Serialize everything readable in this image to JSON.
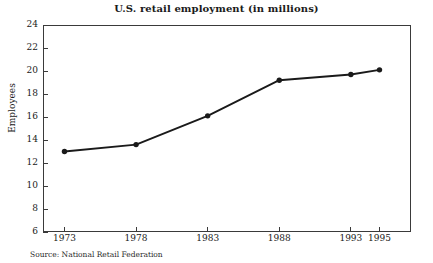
{
  "chart_data": {
    "type": "line",
    "title": "U.S. retail employment (in millions)",
    "xlabel": "",
    "ylabel": "Employees",
    "x": [
      1973,
      1978,
      1983,
      1988,
      1993,
      1995
    ],
    "xtick_labels": [
      "1973",
      "1978",
      "1983",
      "1988",
      "1993",
      "1995"
    ],
    "values": [
      13.0,
      13.6,
      16.1,
      19.2,
      19.7,
      20.1
    ],
    "ytick_labels": [
      "24",
      "22",
      "20",
      "18",
      "16",
      "14",
      "12",
      "10",
      "8",
      "6"
    ],
    "yticks": [
      24,
      22,
      20,
      18,
      16,
      14,
      12,
      10,
      8,
      6
    ],
    "ylim": [
      6,
      24
    ],
    "xlim": [
      1971.5,
      1997.2
    ],
    "grid": false,
    "legend": false,
    "marker": "filled-circle",
    "line_color": "#1a1a1a",
    "marker_color": "#1a1a1a",
    "frame_color": "#3a3a3a",
    "background": "#ffffff"
  },
  "source": {
    "label": "Source: National Retail Federation"
  }
}
